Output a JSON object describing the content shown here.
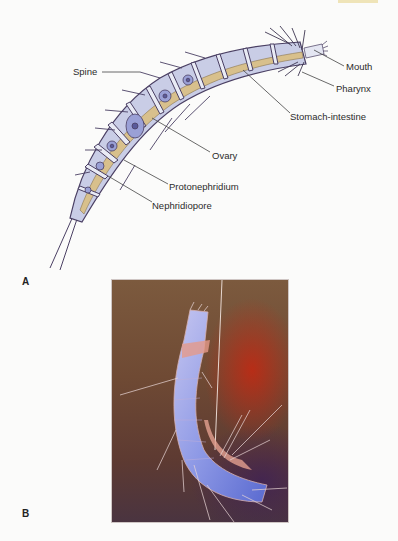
{
  "figure": {
    "panel_a": {
      "letter": "A",
      "labels": {
        "spine": "Spine",
        "mouth": "Mouth",
        "pharynx": "Pharynx",
        "stomach_intestine": "Stomach-intestine",
        "ovary": "Ovary",
        "protonephridium": "Protonephridium",
        "nephridiopore": "Nephridiopore"
      }
    },
    "panel_b": {
      "letter": "B"
    },
    "colors": {
      "body_fill": "#c9cde6",
      "gut_fill": "#d8c08c",
      "outline": "#4a3f63",
      "leader_line": "#444444",
      "photo_bg": "#6f4a34",
      "photo_red": "#c42812",
      "specimen_blue": "#7f8fe0"
    }
  }
}
